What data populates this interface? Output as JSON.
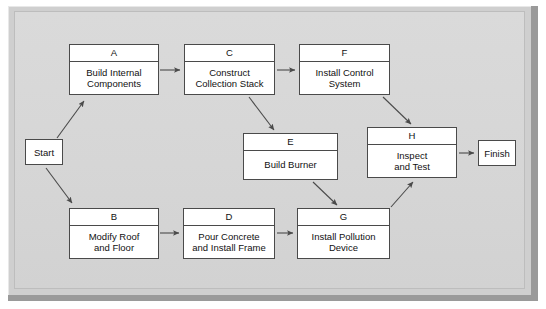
{
  "diagram": {
    "type": "activity-on-node-network",
    "title": "",
    "background_color": "#d7d7d7",
    "node_fill": "#ffffff",
    "node_stroke": "#4a4a4a",
    "terminals": [
      {
        "id": "start",
        "label": "Start",
        "x": 25,
        "y": 139,
        "w": 38,
        "h": 26
      },
      {
        "id": "finish",
        "label": "Finish",
        "x": 478,
        "y": 140,
        "w": 38,
        "h": 26
      }
    ],
    "nodes": [
      {
        "id": "A",
        "code": "A",
        "label": "Build Internal\nComponents",
        "x": 69,
        "y": 44,
        "w": 90,
        "h": 51
      },
      {
        "id": "C",
        "code": "C",
        "label": "Construct\nCollection Stack",
        "x": 184,
        "y": 44,
        "w": 91,
        "h": 51
      },
      {
        "id": "F",
        "code": "F",
        "label": "Install Control\nSystem",
        "x": 299,
        "y": 44,
        "w": 91,
        "h": 51
      },
      {
        "id": "E",
        "code": "E",
        "label": "Build Burner",
        "x": 243,
        "y": 133,
        "w": 95,
        "h": 47
      },
      {
        "id": "H",
        "code": "H",
        "label": "Inspect\nand Test",
        "x": 367,
        "y": 127,
        "w": 90,
        "h": 51
      },
      {
        "id": "B",
        "code": "B",
        "label": "Modify Roof\nand Floor",
        "x": 69,
        "y": 208,
        "w": 90,
        "h": 51
      },
      {
        "id": "D",
        "code": "D",
        "label": "Pour Concrete\nand Install Frame",
        "x": 183,
        "y": 208,
        "w": 92,
        "h": 51
      },
      {
        "id": "G",
        "code": "G",
        "label": "Install Pollution\nDevice",
        "x": 297,
        "y": 208,
        "w": 93,
        "h": 51
      }
    ],
    "edges": [
      {
        "from": "start",
        "to": "A",
        "path": "M 57,138 L 84,101",
        "kind": "diagonal-up"
      },
      {
        "from": "start",
        "to": "B",
        "path": "M 46,168 L 72,203",
        "kind": "diagonal-down"
      },
      {
        "from": "A",
        "to": "C",
        "path": "M 160,70 L 180,70",
        "kind": "horizontal"
      },
      {
        "from": "C",
        "to": "F",
        "path": "M 277,70 L 295,70",
        "kind": "horizontal"
      },
      {
        "from": "C",
        "to": "E",
        "path": "M 249,97 L 274,130",
        "kind": "diagonal-down"
      },
      {
        "from": "F",
        "to": "H",
        "path": "M 383,97 L 411,124",
        "kind": "diagonal-down"
      },
      {
        "from": "E",
        "to": "G",
        "path": "M 313,182 L 337,205",
        "kind": "diagonal-down"
      },
      {
        "from": "B",
        "to": "D",
        "path": "M 160,233 L 179,233",
        "kind": "horizontal"
      },
      {
        "from": "D",
        "to": "G",
        "path": "M 277,233 L 293,233",
        "kind": "horizontal"
      },
      {
        "from": "G",
        "to": "H",
        "path": "M 391,207 L 413,182",
        "kind": "diagonal-up"
      },
      {
        "from": "H",
        "to": "finish",
        "path": "M 459,153 L 474,153",
        "kind": "horizontal"
      }
    ]
  }
}
